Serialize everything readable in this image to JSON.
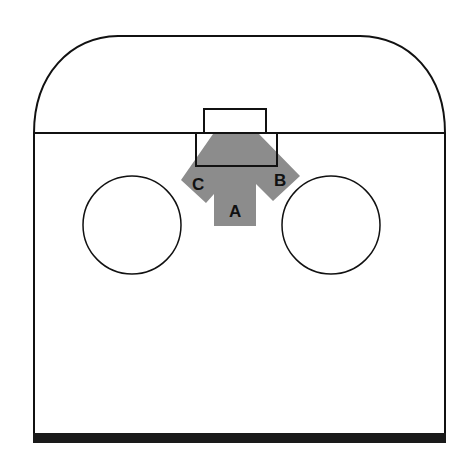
{
  "diagram": {
    "labels": {
      "a": "A",
      "b": "B",
      "c": "C"
    },
    "colors": {
      "outline": "#111111",
      "shaded_region": "#8c8c8c",
      "background": "#ffffff",
      "base_bar": "#1a1a1a"
    },
    "elements": [
      "rounded-top outline",
      "horizontal divider line",
      "small top rectangle",
      "lower rectangle",
      "shaded arrow-shaped region",
      "left circle",
      "right circle",
      "thick base bar"
    ]
  }
}
